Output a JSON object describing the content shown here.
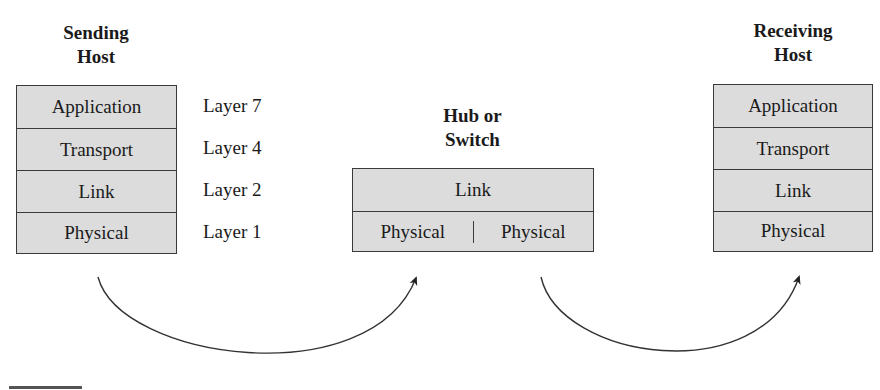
{
  "sending_host": {
    "title_line1": "Sending",
    "title_line2": "Host",
    "layers": [
      "Application",
      "Transport",
      "Link",
      "Physical"
    ]
  },
  "layer_labels": [
    "Layer 7",
    "Layer 4",
    "Layer 2",
    "Layer 1"
  ],
  "hub": {
    "title_line1": "Hub or",
    "title_line2": "Switch",
    "top": "Link",
    "bottom_left": "Physical",
    "bottom_right": "Physical"
  },
  "receiving_host": {
    "title_line1": "Receiving",
    "title_line2": "Host",
    "layers": [
      "Application",
      "Transport",
      "Link",
      "Physical"
    ]
  },
  "colors": {
    "box_fill": "#dcdcdc",
    "border": "#3a3a3a",
    "arrow": "#333333"
  }
}
